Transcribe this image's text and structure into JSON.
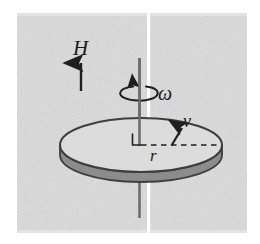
{
  "figure": {
    "type": "physics-diagram",
    "background_color": "#dcdcdc",
    "page_color": "#ffffff",
    "ink_color": "#4a4a4a",
    "label_color": "#1a1a1a",
    "disk_top_fill": "#dcdcdc",
    "disk_edge_fill": "#8c8c8c",
    "seam_color": "#ffffff"
  },
  "labels": {
    "field": "H",
    "angular_velocity": "ω",
    "velocity": "v",
    "radius": "r"
  },
  "annotations": {
    "field_arrow": "upward-arrow",
    "rotation_arrow": "circular-arrow-counterclockwise",
    "velocity_arrow": "tangential-arrow",
    "radius_line": "dashed-line",
    "right_angle_mark": "perpendicular-mark",
    "axis": "vertical-rotation-axis"
  }
}
